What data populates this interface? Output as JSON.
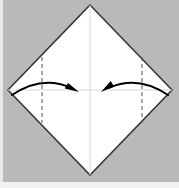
{
  "figure": {
    "canvas": {
      "width": 179,
      "height": 188
    },
    "colors": {
      "background": "#b9b9b9",
      "background_bottom_band": "#f2f2f2",
      "background_left_band": "#e8e8e8",
      "paper_fill": "#ffffff",
      "paper_edge": "#3a3a3a",
      "crease_line": "#d8d8d8",
      "fold_guide_dashed": "#555555",
      "arrow": "#000000"
    }
  },
  "paper": {
    "name": "square-sheet-diamond",
    "shape": "diamond",
    "vertices": {
      "top": {
        "x": 90,
        "y": 5
      },
      "right": {
        "x": 172,
        "y": 90
      },
      "bottom": {
        "x": 90,
        "y": 175
      },
      "left": {
        "x": 8,
        "y": 90
      }
    },
    "edge_width": 1.6
  },
  "creases": [
    {
      "name": "vertical-center-crease",
      "orientation": "vertical",
      "x": 90,
      "y1": 5,
      "y2": 175,
      "style": "solid-faint"
    },
    {
      "name": "horizontal-center-crease",
      "orientation": "horizontal",
      "y": 90,
      "x1": 8,
      "x2": 172,
      "style": "solid-faint"
    }
  ],
  "fold_guides": [
    {
      "name": "left-fold-guide",
      "orientation": "vertical",
      "x": 42,
      "y1": 57,
      "y2": 123,
      "style": "dashed",
      "dash_pattern": "4 3"
    },
    {
      "name": "right-fold-guide",
      "orientation": "vertical",
      "x": 142,
      "y1": 57,
      "y2": 123,
      "style": "dashed",
      "dash_pattern": "4 3"
    }
  ],
  "arrows": [
    {
      "name": "left-fold-arrow",
      "direction": "left-to-right",
      "meaning": "fold left corner to center",
      "start": {
        "x": 12,
        "y": 95
      },
      "control": {
        "x": 46,
        "y": 72
      },
      "end": {
        "x": 79,
        "y": 92
      },
      "head_angle_deg": 35,
      "stroke_width": 2.1
    },
    {
      "name": "right-fold-arrow",
      "direction": "right-to-left",
      "meaning": "fold right corner to center",
      "start": {
        "x": 168,
        "y": 95
      },
      "control": {
        "x": 134,
        "y": 72
      },
      "end": {
        "x": 101,
        "y": 92
      },
      "head_angle_deg": 145,
      "stroke_width": 2.1
    }
  ]
}
